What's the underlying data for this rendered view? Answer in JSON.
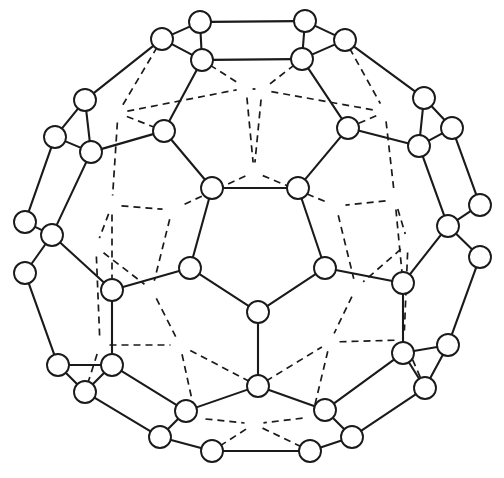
{
  "figure": {
    "title": "Truncated icosahedron (buckminsterfullerene C60) graph",
    "background_color": "#ffffff",
    "line_color": "#1a1a1a",
    "vertex_fill": "#ffffff",
    "vertex_radius": 11,
    "vertex_count": 60,
    "edge_count": 90,
    "canvas": {
      "width": 504,
      "height": 478
    }
  },
  "graph": {
    "vertices": [
      {
        "id": 0,
        "x": 200,
        "y": 22,
        "layer": "front"
      },
      {
        "id": 1,
        "x": 305,
        "y": 21,
        "layer": "front"
      },
      {
        "id": 2,
        "x": 162,
        "y": 39,
        "layer": "front"
      },
      {
        "id": 3,
        "x": 345,
        "y": 40,
        "layer": "front"
      },
      {
        "id": 4,
        "x": 202,
        "y": 60,
        "layer": "front"
      },
      {
        "id": 5,
        "x": 302,
        "y": 59,
        "layer": "front"
      },
      {
        "id": 6,
        "x": 85,
        "y": 100,
        "layer": "front"
      },
      {
        "id": 7,
        "x": 424,
        "y": 98,
        "layer": "front"
      },
      {
        "id": 8,
        "x": 55,
        "y": 137,
        "layer": "front"
      },
      {
        "id": 9,
        "x": 452,
        "y": 128,
        "layer": "front"
      },
      {
        "id": 10,
        "x": 91,
        "y": 152,
        "layer": "front"
      },
      {
        "id": 11,
        "x": 419,
        "y": 146,
        "layer": "front"
      },
      {
        "id": 12,
        "x": 164,
        "y": 131,
        "layer": "front"
      },
      {
        "id": 13,
        "x": 348,
        "y": 128,
        "layer": "front"
      },
      {
        "id": 14,
        "x": 212,
        "y": 188,
        "layer": "front"
      },
      {
        "id": 15,
        "x": 298,
        "y": 188,
        "layer": "front"
      },
      {
        "id": 16,
        "x": 25,
        "y": 222,
        "layer": "front"
      },
      {
        "id": 17,
        "x": 480,
        "y": 205,
        "layer": "front"
      },
      {
        "id": 18,
        "x": 52,
        "y": 235,
        "layer": "front"
      },
      {
        "id": 19,
        "x": 448,
        "y": 226,
        "layer": "front"
      },
      {
        "id": 20,
        "x": 25,
        "y": 273,
        "layer": "front"
      },
      {
        "id": 21,
        "x": 480,
        "y": 257,
        "layer": "front"
      },
      {
        "id": 22,
        "x": 190,
        "y": 268,
        "layer": "front"
      },
      {
        "id": 23,
        "x": 325,
        "y": 268,
        "layer": "front"
      },
      {
        "id": 24,
        "x": 112,
        "y": 290,
        "layer": "front"
      },
      {
        "id": 25,
        "x": 403,
        "y": 283,
        "layer": "front"
      },
      {
        "id": 26,
        "x": 258,
        "y": 312,
        "layer": "front"
      },
      {
        "id": 27,
        "x": 58,
        "y": 365,
        "layer": "front"
      },
      {
        "id": 28,
        "x": 112,
        "y": 365,
        "layer": "front"
      },
      {
        "id": 29,
        "x": 403,
        "y": 353,
        "layer": "front"
      },
      {
        "id": 30,
        "x": 448,
        "y": 345,
        "layer": "front"
      },
      {
        "id": 31,
        "x": 85,
        "y": 392,
        "layer": "front"
      },
      {
        "id": 32,
        "x": 425,
        "y": 388,
        "layer": "front"
      },
      {
        "id": 33,
        "x": 258,
        "y": 386,
        "layer": "front"
      },
      {
        "id": 34,
        "x": 186,
        "y": 411,
        "layer": "front"
      },
      {
        "id": 35,
        "x": 325,
        "y": 410,
        "layer": "front"
      },
      {
        "id": 36,
        "x": 160,
        "y": 437,
        "layer": "front"
      },
      {
        "id": 37,
        "x": 352,
        "y": 437,
        "layer": "front"
      },
      {
        "id": 38,
        "x": 212,
        "y": 451,
        "layer": "front"
      },
      {
        "id": 39,
        "x": 310,
        "y": 451,
        "layer": "front"
      },
      {
        "id": 40,
        "x": 118,
        "y": 113,
        "layer": "back"
      },
      {
        "id": 41,
        "x": 246,
        "y": 88,
        "layer": "back"
      },
      {
        "id": 42,
        "x": 262,
        "y": 90,
        "layer": "back"
      },
      {
        "id": 43,
        "x": 385,
        "y": 112,
        "layer": "back"
      },
      {
        "id": 44,
        "x": 112,
        "y": 205,
        "layer": "back"
      },
      {
        "id": 45,
        "x": 254,
        "y": 172,
        "layer": "back"
      },
      {
        "id": 46,
        "x": 395,
        "y": 200,
        "layer": "back"
      },
      {
        "id": 47,
        "x": 172,
        "y": 210,
        "layer": "back"
      },
      {
        "id": 48,
        "x": 336,
        "y": 206,
        "layer": "back"
      },
      {
        "id": 49,
        "x": 96,
        "y": 247,
        "layer": "back"
      },
      {
        "id": 50,
        "x": 408,
        "y": 243,
        "layer": "back"
      },
      {
        "id": 51,
        "x": 152,
        "y": 290,
        "layer": "back"
      },
      {
        "id": 52,
        "x": 356,
        "y": 288,
        "layer": "back"
      },
      {
        "id": 53,
        "x": 100,
        "y": 345,
        "layer": "back"
      },
      {
        "id": 54,
        "x": 404,
        "y": 340,
        "layer": "back"
      },
      {
        "id": 55,
        "x": 180,
        "y": 345,
        "layer": "back"
      },
      {
        "id": 56,
        "x": 330,
        "y": 342,
        "layer": "back"
      },
      {
        "id": 57,
        "x": 196,
        "y": 418,
        "layer": "back"
      },
      {
        "id": 58,
        "x": 312,
        "y": 417,
        "layer": "back"
      },
      {
        "id": 59,
        "x": 254,
        "y": 424,
        "layer": "back"
      }
    ],
    "edges_solid": [
      [
        0,
        1
      ],
      [
        0,
        2
      ],
      [
        0,
        4
      ],
      [
        1,
        3
      ],
      [
        1,
        5
      ],
      [
        4,
        5
      ],
      [
        2,
        4
      ],
      [
        3,
        5
      ],
      [
        2,
        6
      ],
      [
        3,
        7
      ],
      [
        6,
        8
      ],
      [
        6,
        10
      ],
      [
        8,
        10
      ],
      [
        8,
        16
      ],
      [
        7,
        9
      ],
      [
        7,
        11
      ],
      [
        9,
        11
      ],
      [
        9,
        17
      ],
      [
        10,
        12
      ],
      [
        11,
        13
      ],
      [
        12,
        14
      ],
      [
        13,
        15
      ],
      [
        4,
        12
      ],
      [
        5,
        13
      ],
      [
        14,
        15
      ],
      [
        14,
        22
      ],
      [
        15,
        23
      ],
      [
        16,
        18
      ],
      [
        18,
        20
      ],
      [
        17,
        19
      ],
      [
        19,
        21
      ],
      [
        18,
        24
      ],
      [
        19,
        25
      ],
      [
        10,
        18
      ],
      [
        11,
        19
      ],
      [
        22,
        24
      ],
      [
        23,
        25
      ],
      [
        22,
        26
      ],
      [
        23,
        26
      ],
      [
        24,
        28
      ],
      [
        25,
        29
      ],
      [
        20,
        27
      ],
      [
        21,
        30
      ],
      [
        27,
        28
      ],
      [
        27,
        31
      ],
      [
        28,
        31
      ],
      [
        29,
        30
      ],
      [
        29,
        32
      ],
      [
        30,
        32
      ],
      [
        26,
        33
      ],
      [
        28,
        34
      ],
      [
        29,
        35
      ],
      [
        31,
        36
      ],
      [
        32,
        37
      ],
      [
        33,
        34
      ],
      [
        33,
        35
      ],
      [
        34,
        36
      ],
      [
        35,
        37
      ],
      [
        36,
        38
      ],
      [
        37,
        39
      ],
      [
        38,
        39
      ]
    ],
    "edges_dashed": [
      [
        4,
        41
      ],
      [
        5,
        42
      ],
      [
        41,
        42
      ],
      [
        41,
        45
      ],
      [
        42,
        45
      ],
      [
        2,
        40
      ],
      [
        3,
        43
      ],
      [
        40,
        41
      ],
      [
        42,
        43
      ],
      [
        40,
        44
      ],
      [
        43,
        46
      ],
      [
        40,
        12
      ],
      [
        43,
        13
      ],
      [
        44,
        47
      ],
      [
        46,
        48
      ],
      [
        45,
        47
      ],
      [
        45,
        48
      ],
      [
        44,
        49
      ],
      [
        46,
        50
      ],
      [
        47,
        51
      ],
      [
        48,
        52
      ],
      [
        49,
        51
      ],
      [
        50,
        52
      ],
      [
        49,
        53
      ],
      [
        50,
        54
      ],
      [
        51,
        55
      ],
      [
        52,
        56
      ],
      [
        53,
        55
      ],
      [
        54,
        56
      ],
      [
        53,
        31
      ],
      [
        54,
        32
      ],
      [
        55,
        57
      ],
      [
        56,
        58
      ],
      [
        57,
        59
      ],
      [
        58,
        59
      ],
      [
        57,
        34
      ],
      [
        58,
        35
      ],
      [
        59,
        38
      ],
      [
        59,
        39
      ],
      [
        44,
        24
      ],
      [
        46,
        25
      ],
      [
        33,
        55
      ],
      [
        33,
        56
      ]
    ]
  }
}
